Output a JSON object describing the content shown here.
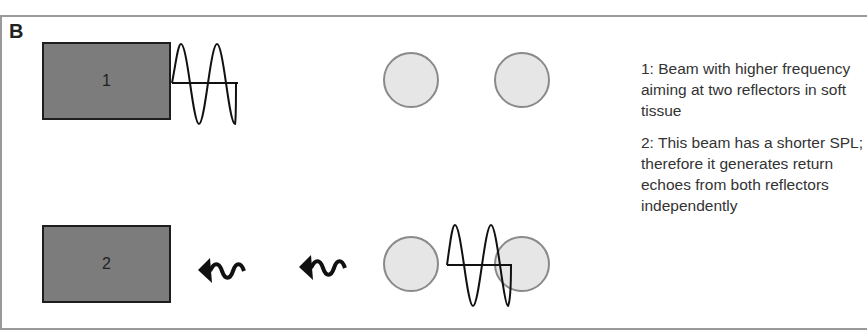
{
  "panel": {
    "label": "B"
  },
  "transducers": [
    {
      "id": "1",
      "label": "1"
    },
    {
      "id": "2",
      "label": "2"
    }
  ],
  "notes": [
    "1: Beam with higher frequency aiming at two reflectors in soft tissue",
    "2: This beam has a shorter SPL; therefore it generates return echoes from both reflectors independently"
  ],
  "colors": {
    "transducer_fill": "#7c7c7c",
    "reflector_fill": "#e6e6e6",
    "reflector_stroke": "#8a8a8a",
    "wave_stroke": "#111111",
    "frame": "#9a9a9a"
  },
  "icons": [
    "sine-wave-pulse",
    "reflector-circle",
    "echo-arrow"
  ]
}
